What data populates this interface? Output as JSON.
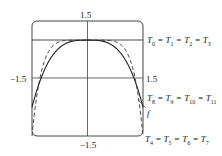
{
  "chart_data": {
    "type": "line",
    "title": "",
    "xlabel": "",
    "ylabel": "",
    "xlim": [
      -1.5,
      1.5
    ],
    "ylim": [
      -1.5,
      1.5
    ],
    "grid": false,
    "tick_labels": {
      "y_top": "1.5",
      "y_bottom": "−1.5",
      "x_left": "−1.5",
      "x_right": "1.5"
    },
    "series": [
      {
        "name": "T0 = T1 = T2 = T3",
        "style": "solid",
        "description": "constant approximation y = 1",
        "values_note": "horizontal line at y=1"
      },
      {
        "name": "T4 = T5 = T6 = T7",
        "style": "dashed",
        "description": "higher-order approximation bending down to y=-1.5 at x=±1.5"
      },
      {
        "name": "T8 = T9 = T10 = T11",
        "style": "solid",
        "description": "approximation close to f"
      },
      {
        "name": "f",
        "style": "solid",
        "description": "target function, flat top near y=1, descending to about y=-0.7 at x=±1.5"
      }
    ],
    "annotations": [
      "T0 = T1 = T2 = T3",
      "T8 = T9 = T10 = T11",
      "f",
      "T4 = T5 = T6 = T7"
    ]
  },
  "labels": {
    "y_top": "1.5",
    "y_bottom": "−1.5",
    "x_left": "−1.5",
    "x_right": "1.5",
    "f": "f"
  },
  "legend": [
    {
      "base": "T",
      "subs": [
        "0",
        "1",
        "2",
        "3"
      ]
    },
    {
      "base": "T",
      "subs": [
        "8",
        "9",
        "10",
        "11"
      ]
    },
    {
      "base": "T",
      "subs": [
        "4",
        "5",
        "6",
        "7"
      ]
    }
  ]
}
